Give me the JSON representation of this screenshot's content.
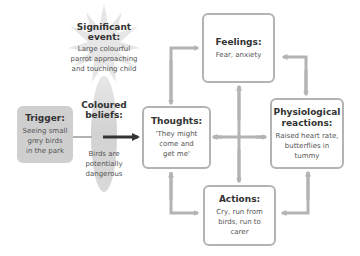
{
  "diagram": {
    "significant_event": {
      "title": "Significant event:",
      "body_lines": [
        "Large colourful",
        "parrot approaching",
        "and touching child"
      ]
    },
    "coloured_beliefs": {
      "title": "Coloured beliefs:",
      "body_lines": [
        "Birds are",
        "potentially",
        "dangerous"
      ]
    },
    "trigger": {
      "title": "Trigger:",
      "body_lines": [
        "Seeing small",
        "grey birds",
        "in the park"
      ]
    },
    "thoughts": {
      "title": "Thoughts:",
      "body_lines": [
        "'They might",
        "come and",
        "get me'"
      ]
    },
    "feelings": {
      "title": "Feelings:",
      "body_lines": [
        "Fear, anxiety"
      ]
    },
    "physiological": {
      "title_lines": [
        "Physiological",
        "reactions:"
      ],
      "body_lines": [
        "Raised heart rate,",
        "butterflies in",
        "tummy"
      ]
    },
    "actions": {
      "title": "Actions:",
      "body_lines": [
        "Cry, run from",
        "birds, run to",
        "carer"
      ]
    },
    "colors": {
      "box_border": "#b3b3b3",
      "arrow_grey": "#b3b3b3",
      "trigger_fill": "#cfcfcf",
      "belief_fill": "#d6d6d6",
      "starburst_fill": "#e4e4e4",
      "dark_arrow": "#333333"
    }
  }
}
